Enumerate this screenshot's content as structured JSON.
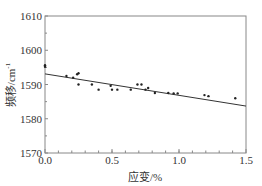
{
  "chart_data": {
    "type": "scatter",
    "title": "",
    "xlabel": "应变/%",
    "ylabel": "频移/cm",
    "ylabel_superscript": "-1",
    "xlim": [
      0.0,
      1.5
    ],
    "ylim": [
      1570,
      1610
    ],
    "xticks": [
      "0.0",
      "0.5",
      "1.0",
      "1.5"
    ],
    "yticks": [
      "1570",
      "1580",
      "1590",
      "1600",
      "1610"
    ],
    "grid": false,
    "legend": null,
    "series": [
      {
        "name": "measured",
        "type": "scatter",
        "x": [
          0.0,
          0.0,
          0.16,
          0.21,
          0.24,
          0.25,
          0.25,
          0.35,
          0.4,
          0.49,
          0.5,
          0.54,
          0.64,
          0.69,
          0.72,
          0.75,
          0.77,
          0.82,
          0.92,
          0.96,
          0.99,
          1.19,
          1.22,
          1.42
        ],
        "y": [
          1595.6,
          1595.2,
          1592.5,
          1592.0,
          1593.0,
          1593.3,
          1590.0,
          1590.0,
          1588.5,
          1589.6,
          1588.5,
          1588.5,
          1588.5,
          1590.0,
          1590.0,
          1588.5,
          1589.0,
          1587.5,
          1587.5,
          1587.4,
          1587.4,
          1586.9,
          1586.6,
          1586.0
        ]
      },
      {
        "name": "linear fit",
        "type": "line",
        "x": [
          0.0,
          1.5
        ],
        "y": [
          1593.1,
          1583.7
        ]
      }
    ]
  }
}
